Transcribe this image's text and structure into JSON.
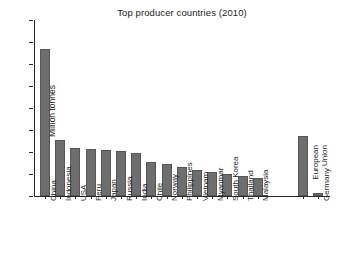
{
  "chart_data": {
    "type": "bar",
    "title": "Top producer countries (2010)",
    "xlabel": "",
    "ylabel": "Million tonnes",
    "ylim": [
      0,
      16
    ],
    "yticks": [
      0,
      2,
      4,
      6,
      8,
      10,
      12,
      14,
      16
    ],
    "grid": false,
    "legend": null,
    "bar_color": "#6e6e6e",
    "categories": [
      "China",
      "Indonesia",
      "USA",
      "Peru",
      "Japan",
      "Russia",
      "India",
      "Chile",
      "Norway",
      "Philippines",
      "Vietnam",
      "Myanmar",
      "South Korea",
      "Thailand",
      "Malaysia",
      "European Union",
      "Germany"
    ],
    "values": [
      13.4,
      5.1,
      4.4,
      4.3,
      4.2,
      4.1,
      3.9,
      3.1,
      2.9,
      2.6,
      2.4,
      2.2,
      2.0,
      1.8,
      1.6,
      5.5,
      0.3
    ]
  },
  "axis": {
    "y_title": "Million tonnes"
  }
}
